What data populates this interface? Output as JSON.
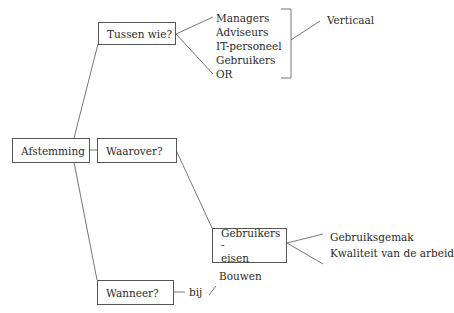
{
  "diagram": {
    "root": {
      "label": "Afstemming"
    },
    "branches": [
      {
        "label": "Tussen wie?",
        "items": [
          "Managers",
          "Adviseurs",
          "IT-personeel",
          "Gebruikers",
          "OR"
        ],
        "group_label": "Verticaal"
      },
      {
        "label": "Waarover?",
        "child": {
          "label_line1": "Gebruikers -",
          "label_line2": "eisen",
          "items": [
            "Gebruiksgemak",
            "Kwaliteit van de arbeid"
          ]
        }
      },
      {
        "label": "Wanneer?",
        "connector": "bij",
        "item": "Bouwen"
      }
    ]
  },
  "colors": {
    "line": "#555555",
    "text": "#2a2a2a",
    "background": "#ffffff"
  }
}
